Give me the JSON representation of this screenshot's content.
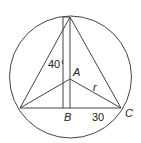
{
  "diagram": {
    "labels": {
      "A": "A",
      "B": "B",
      "C": "C",
      "r": "r",
      "height": "40",
      "base": "30"
    },
    "colors": {
      "stroke": "#444444",
      "background": "#ffffff"
    }
  }
}
